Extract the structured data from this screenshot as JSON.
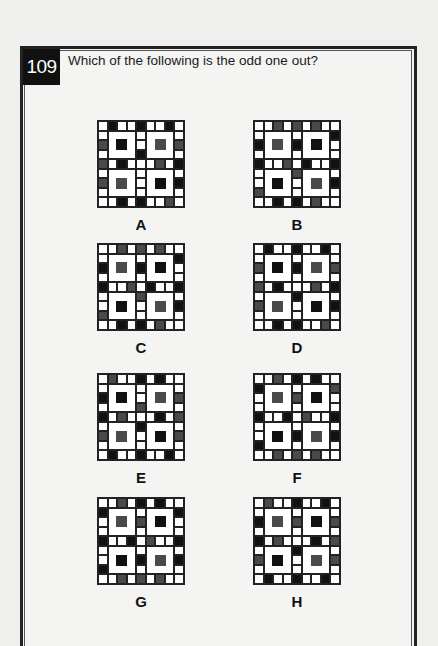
{
  "question": {
    "number": "109",
    "text": "Which of the following is the odd one out?"
  },
  "legend": {
    "W": "#ffffff",
    "K": "#111111",
    "G": "#4a4a4a"
  },
  "options": [
    {
      "label": "A",
      "left": 97,
      "top": 120,
      "top_row": [
        "W",
        "K",
        "W",
        "W",
        "K",
        "W",
        "W",
        "K",
        "W"
      ],
      "bottom_row": [
        "W",
        "W",
        "K",
        "W",
        "K",
        "W",
        "W",
        "G",
        "W"
      ],
      "left_col": [
        "W",
        "G",
        "W",
        "G",
        "W",
        "G",
        "W"
      ],
      "right_col": [
        "W",
        "G",
        "W",
        "K",
        "W",
        "K",
        "W"
      ],
      "mid_row": [
        "W",
        "K",
        "W",
        "W",
        "W",
        "G",
        "W"
      ],
      "mid_col": [
        "W",
        "W",
        "K",
        "W",
        "W",
        "W"
      ],
      "centers": [
        "K",
        "G",
        "G",
        "K"
      ]
    },
    {
      "label": "B",
      "left": 253,
      "top": 120,
      "top_row": [
        "W",
        "W",
        "G",
        "W",
        "G",
        "W",
        "G",
        "W",
        "W"
      ],
      "bottom_row": [
        "W",
        "W",
        "K",
        "W",
        "K",
        "W",
        "G",
        "W",
        "W"
      ],
      "left_col": [
        "W",
        "K",
        "W",
        "K",
        "W",
        "W",
        "G"
      ],
      "right_col": [
        "K",
        "W",
        "W",
        "K",
        "W",
        "K",
        "W"
      ],
      "mid_row": [
        "W",
        "W",
        "G",
        "W",
        "K",
        "W",
        "W"
      ],
      "mid_col": [
        "W",
        "K",
        "W",
        "G",
        "W",
        "W"
      ],
      "centers": [
        "G",
        "K",
        "K",
        "G"
      ]
    },
    {
      "label": "C",
      "left": 97,
      "top": 243,
      "top_row": [
        "W",
        "W",
        "G",
        "W",
        "G",
        "W",
        "G",
        "W",
        "W"
      ],
      "bottom_row": [
        "W",
        "W",
        "K",
        "W",
        "K",
        "W",
        "G",
        "W",
        "W"
      ],
      "left_col": [
        "W",
        "K",
        "W",
        "K",
        "W",
        "W",
        "G"
      ],
      "right_col": [
        "K",
        "W",
        "W",
        "K",
        "W",
        "K",
        "W"
      ],
      "mid_row": [
        "W",
        "W",
        "G",
        "W",
        "K",
        "W",
        "W"
      ],
      "mid_col": [
        "W",
        "K",
        "W",
        "G",
        "W",
        "W"
      ],
      "centers": [
        "G",
        "K",
        "K",
        "G"
      ]
    },
    {
      "label": "D",
      "left": 253,
      "top": 243,
      "top_row": [
        "W",
        "K",
        "W",
        "W",
        "K",
        "W",
        "W",
        "K",
        "W"
      ],
      "bottom_row": [
        "W",
        "W",
        "K",
        "W",
        "K",
        "W",
        "W",
        "G",
        "W"
      ],
      "left_col": [
        "W",
        "G",
        "W",
        "G",
        "W",
        "G",
        "W"
      ],
      "right_col": [
        "W",
        "G",
        "W",
        "K",
        "W",
        "K",
        "W"
      ],
      "mid_row": [
        "W",
        "K",
        "W",
        "W",
        "W",
        "G",
        "W"
      ],
      "mid_col": [
        "W",
        "K",
        "W",
        "K",
        "W",
        "W"
      ],
      "centers": [
        "K",
        "G",
        "G",
        "K"
      ]
    },
    {
      "label": "E",
      "left": 97,
      "top": 373,
      "top_row": [
        "W",
        "G",
        "W",
        "W",
        "K",
        "W",
        "K",
        "W",
        "W"
      ],
      "bottom_row": [
        "W",
        "K",
        "W",
        "W",
        "K",
        "W",
        "W",
        "K",
        "W"
      ],
      "left_col": [
        "W",
        "K",
        "W",
        "K",
        "W",
        "G",
        "W"
      ],
      "right_col": [
        "W",
        "G",
        "W",
        "G",
        "W",
        "G",
        "W"
      ],
      "mid_row": [
        "W",
        "G",
        "W",
        "W",
        "W",
        "K",
        "W"
      ],
      "mid_col": [
        "W",
        "W",
        "G",
        "K",
        "W",
        "W"
      ],
      "centers": [
        "K",
        "G",
        "G",
        "K"
      ]
    },
    {
      "label": "F",
      "left": 253,
      "top": 373,
      "top_row": [
        "W",
        "W",
        "G",
        "W",
        "K",
        "W",
        "K",
        "W",
        "W"
      ],
      "bottom_row": [
        "W",
        "W",
        "G",
        "W",
        "G",
        "W",
        "G",
        "W",
        "W"
      ],
      "left_col": [
        "K",
        "W",
        "W",
        "K",
        "W",
        "W",
        "K"
      ],
      "right_col": [
        "G",
        "W",
        "W",
        "K",
        "W",
        "K",
        "W"
      ],
      "mid_row": [
        "W",
        "W",
        "K",
        "W",
        "G",
        "W",
        "W"
      ],
      "mid_col": [
        "W",
        "G",
        "W",
        "W",
        "K",
        "W"
      ],
      "centers": [
        "G",
        "K",
        "K",
        "G"
      ]
    },
    {
      "label": "G",
      "left": 97,
      "top": 497,
      "top_row": [
        "W",
        "W",
        "G",
        "W",
        "K",
        "W",
        "K",
        "W",
        "W"
      ],
      "bottom_row": [
        "W",
        "W",
        "G",
        "W",
        "G",
        "W",
        "G",
        "W",
        "W"
      ],
      "left_col": [
        "K",
        "W",
        "W",
        "K",
        "W",
        "W",
        "K"
      ],
      "right_col": [
        "K",
        "W",
        "W",
        "K",
        "W",
        "K",
        "W"
      ],
      "mid_row": [
        "W",
        "W",
        "K",
        "W",
        "G",
        "W",
        "W"
      ],
      "mid_col": [
        "W",
        "G",
        "W",
        "W",
        "K",
        "W"
      ],
      "centers": [
        "G",
        "K",
        "K",
        "G"
      ]
    },
    {
      "label": "H",
      "left": 253,
      "top": 497,
      "top_row": [
        "W",
        "G",
        "W",
        "W",
        "K",
        "W",
        "W",
        "K",
        "W"
      ],
      "bottom_row": [
        "W",
        "K",
        "W",
        "W",
        "K",
        "W",
        "W",
        "K",
        "W"
      ],
      "left_col": [
        "W",
        "K",
        "W",
        "K",
        "W",
        "G",
        "W"
      ],
      "right_col": [
        "W",
        "G",
        "W",
        "G",
        "W",
        "G",
        "W"
      ],
      "mid_row": [
        "W",
        "G",
        "W",
        "W",
        "W",
        "K",
        "W"
      ],
      "mid_col": [
        "W",
        "G",
        "W",
        "K",
        "W",
        "W"
      ],
      "centers": [
        "G",
        "K",
        "K",
        "G"
      ]
    }
  ]
}
